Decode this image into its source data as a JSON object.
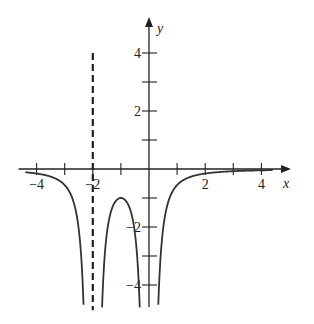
{
  "chart_data": {
    "type": "line",
    "title": "",
    "xlabel": "x",
    "ylabel": "y",
    "xlim": [
      -4.5,
      4.7
    ],
    "ylim": [
      -4.8,
      4.9
    ],
    "grid": false,
    "x_ticks": [
      -4,
      -3,
      -2,
      -1,
      1,
      2,
      3,
      4
    ],
    "x_tick_labels": [
      {
        "value": -4,
        "label": "−4"
      },
      {
        "value": -2,
        "label": "−2"
      },
      {
        "value": 2,
        "label": "2"
      },
      {
        "value": 4,
        "label": "4"
      }
    ],
    "y_ticks": [
      -4,
      -3,
      -2,
      -1,
      1,
      2,
      3,
      4
    ],
    "y_tick_labels": [
      {
        "value": 4,
        "label": "4"
      },
      {
        "value": 2,
        "label": "2"
      },
      {
        "value": -2,
        "label": "−2"
      },
      {
        "value": -4,
        "label": "−4"
      }
    ],
    "series": [
      {
        "name": "f(x)",
        "description": "curve with vertical asymptotes at x = -2 and x = 0, local maximum about -1 at x = -1, approaching 0 as x -> ±infinity",
        "points": [
          {
            "x": -4.4,
            "y": -0.04
          },
          {
            "x": -4.0,
            "y": -0.16
          },
          {
            "x": -3.5,
            "y": -0.26
          },
          {
            "x": -3.0,
            "y": -0.56
          },
          {
            "x": -2.6,
            "y": -1.46
          },
          {
            "x": -2.4,
            "y": -3.2
          },
          {
            "x": -2.33,
            "y": -4.4
          },
          {
            "x": -1.68,
            "y": -4.4
          },
          {
            "x": -1.6,
            "y": -3.3
          },
          {
            "x": -1.4,
            "y": -1.64
          },
          {
            "x": -1.2,
            "y": -1.13
          },
          {
            "x": -1.0,
            "y": -1.0
          },
          {
            "x": -0.8,
            "y": -1.13
          },
          {
            "x": -0.6,
            "y": -1.64
          },
          {
            "x": -0.4,
            "y": -3.3
          },
          {
            "x": -0.33,
            "y": -4.4
          },
          {
            "x": 0.33,
            "y": -4.4
          },
          {
            "x": 0.4,
            "y": -3.2
          },
          {
            "x": 0.6,
            "y": -1.46
          },
          {
            "x": 1.0,
            "y": -0.56
          },
          {
            "x": 1.5,
            "y": -0.26
          },
          {
            "x": 2.0,
            "y": -0.16
          },
          {
            "x": 3.0,
            "y": -0.08
          },
          {
            "x": 4.0,
            "y": -0.04
          },
          {
            "x": 4.4,
            "y": -0.04
          }
        ]
      }
    ],
    "asymptotes": [
      {
        "type": "vertical",
        "x": -2,
        "style": "dashed",
        "y_range": [
          -4.8,
          4.0
        ]
      }
    ]
  }
}
